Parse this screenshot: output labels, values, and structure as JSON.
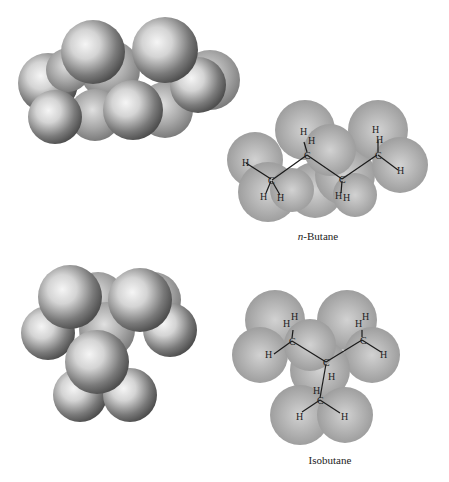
{
  "figure": {
    "top_right_caption_prefix": "n",
    "top_right_caption_suffix": "-Butane",
    "bottom_right_caption": "Isobutane"
  },
  "molecules": [
    {
      "name": "n-Butane",
      "space_filling_model": "left",
      "structural_atoms": {
        "carbon_label": "C",
        "hydrogen_label": "H"
      }
    },
    {
      "name": "Isobutane",
      "space_filling_model": "left",
      "structural_atoms": {
        "carbon_label": "C",
        "hydrogen_label": "H"
      }
    }
  ],
  "colors": {
    "sphere_light": "#f2f2f2",
    "sphere_dark": "#5a5a5a",
    "cloud_mid": "#a8a8a8",
    "cloud_light": "#d6d6d6",
    "bond": "#1a1a1a",
    "text": "#222222"
  }
}
